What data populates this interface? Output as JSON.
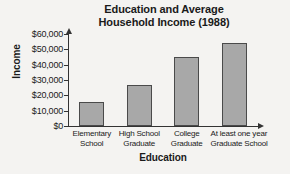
{
  "chart_data": {
    "type": "bar",
    "title": "Education and Average Household Income (1988)",
    "title_lines": [
      "Education and Average",
      "Household Income (1988)"
    ],
    "xlabel": "Education",
    "ylabel": "Income",
    "categories": [
      "Elementary School",
      "High School Graduate",
      "College Graduate",
      "At least one year Graduate School"
    ],
    "category_lines": [
      [
        "Elementary",
        "School"
      ],
      [
        "High School",
        "Graduate"
      ],
      [
        "College",
        "Graduate"
      ],
      [
        "At least one year",
        "Graduate School"
      ]
    ],
    "values": [
      15500,
      27000,
      45000,
      54000
    ],
    "ylim": [
      0,
      60000
    ],
    "ytick_values": [
      60000,
      50000,
      40000,
      30000,
      20000,
      10000,
      0
    ],
    "ytick_labels": [
      "$60,000",
      "$50,000",
      "$40,000",
      "$30,000",
      "$20,000",
      "$10,000",
      "$0"
    ],
    "grid": false,
    "legend": false,
    "bar_color": "#a8a8a8",
    "bar_border_color": "#4a4a4a",
    "axis_color": "#333333",
    "background_color": "#f4f3f1"
  }
}
